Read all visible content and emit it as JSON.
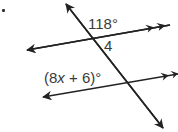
{
  "diagram": {
    "type": "parallel-lines-transversal",
    "problem_marker": ".",
    "labels": {
      "top_angle": "118°",
      "angle_number": "4",
      "bottom_angle_prefix": "(8",
      "bottom_angle_var": "x",
      "bottom_angle_suffix": " + 6)°"
    },
    "lines": [
      {
        "name": "top-parallel-line",
        "parallel_marks": 2
      },
      {
        "name": "bottom-parallel-line",
        "parallel_marks": 2
      },
      {
        "name": "transversal",
        "parallel_marks": 0
      }
    ],
    "colors": {
      "stroke": "#222222",
      "text": "#3a3a3a",
      "background": "#ffffff"
    }
  }
}
